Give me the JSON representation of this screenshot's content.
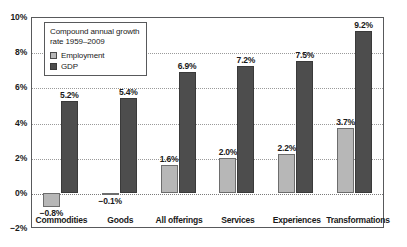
{
  "chart_data": {
    "type": "bar",
    "title": "",
    "subtitle": "",
    "xlabel": "",
    "ylabel": "",
    "ylim": [
      -2,
      10
    ],
    "yticks": [
      "-2%",
      "0%",
      "2%",
      "4%",
      "6%",
      "8%",
      "10%"
    ],
    "ytick_values": [
      -2,
      0,
      2,
      4,
      6,
      8,
      10
    ],
    "grid": true,
    "legend_position": "top-left",
    "legend_title": "Compound annual growth rate 1959–2009",
    "categories": [
      "Commodities",
      "Goods",
      "All offerings",
      "Services",
      "Experiences",
      "Transformations"
    ],
    "series": [
      {
        "name": "Employment",
        "color": "#b7b7b7",
        "values": [
          -0.8,
          -0.1,
          1.6,
          2.0,
          2.2,
          3.7
        ],
        "labels": [
          "−0.8%",
          "−0.1%",
          "1.6%",
          "2.0%",
          "2.2%",
          "3.7%"
        ]
      },
      {
        "name": "GDP",
        "color": "#4d4d4d",
        "values": [
          5.2,
          5.4,
          6.9,
          7.2,
          7.5,
          9.2
        ],
        "labels": [
          "5.2%",
          "5.4%",
          "6.9%",
          "7.2%",
          "7.5%",
          "9.2%"
        ]
      }
    ]
  },
  "legend": {
    "title": "Compound annual growth rate 1959–2009",
    "items": [
      {
        "label": "Employment"
      },
      {
        "label": "GDP"
      }
    ]
  },
  "axis": {
    "y_ticks": [
      "10%",
      "8%",
      "6%",
      "4%",
      "2%",
      "0%",
      "−2%"
    ]
  },
  "colors": {
    "employment": "#b7b7b7",
    "gdp": "#4d4d4d",
    "frame": "#58595b",
    "grid": "#9a9a9a",
    "text": "#1a1a1a",
    "background": "#ffffff"
  }
}
